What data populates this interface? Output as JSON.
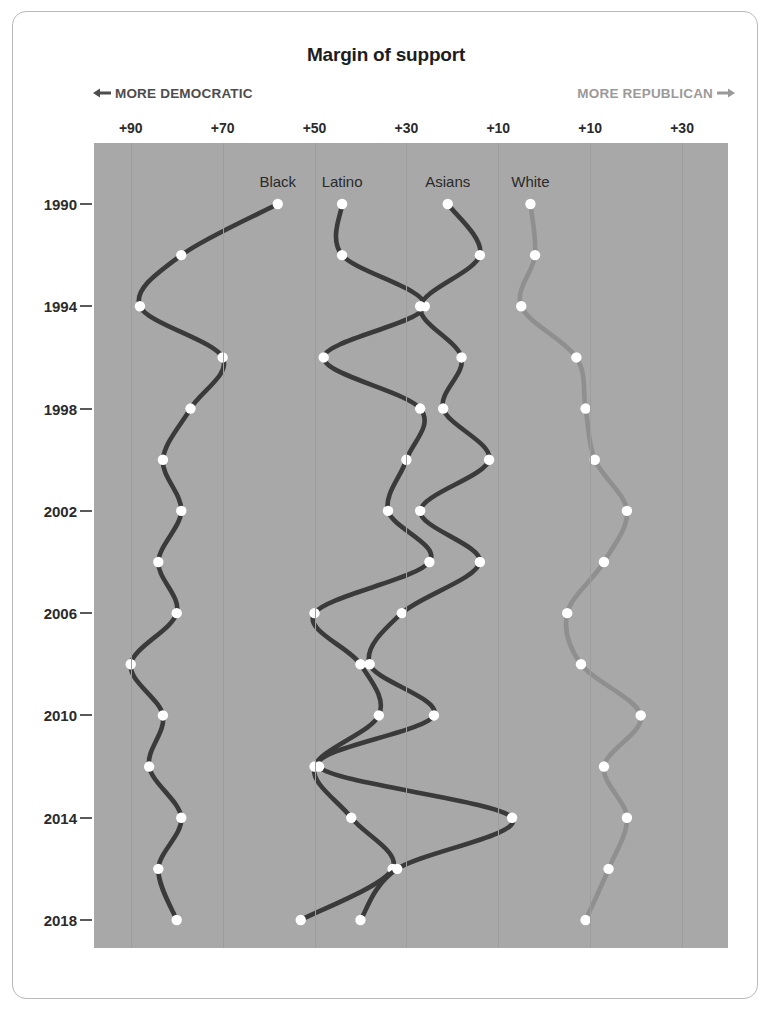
{
  "title": "Margin of support",
  "direction_left": {
    "label": "MORE DEMOCRATIC",
    "arrow": "←"
  },
  "direction_right": {
    "label": "MORE REPUBLICAN",
    "arrow": "→"
  },
  "colors": {
    "plot_background": "#a8a8a8",
    "gridline": "#9d9d9d",
    "dark_series": "#3a3a3a",
    "light_series": "#8f8f8f",
    "marker": "#ffffff",
    "text": "#2b2b2b",
    "democratic_label": "#4d4d4d",
    "republican_label": "#9a9a9a"
  },
  "chart_data": {
    "type": "line",
    "title": "Margin of support",
    "xlabel": "",
    "ylabel": "",
    "orientation": "horizontal-value-vertical-time",
    "grid": true,
    "legend_position": "inline-top",
    "note": "X axis is a two-sided margin: values left of zero are Democratic margin, right of zero are Republican margin. Tick labels read +90 +70 +50 +30 +10 (Democratic) then +10 +30 (Republican).",
    "xtick_labels": [
      "+90",
      "+70",
      "+50",
      "+30",
      "+10",
      "+10",
      "+30"
    ],
    "xtick_values": [
      -90,
      -70,
      -50,
      -30,
      -10,
      10,
      30
    ],
    "xlim": [
      -98,
      40
    ],
    "ylim": [
      1990,
      2018
    ],
    "ytick_labels": [
      "1990",
      "1994",
      "1998",
      "2002",
      "2006",
      "2010",
      "2014",
      "2018"
    ],
    "ytick_values": [
      1990,
      1994,
      1998,
      2002,
      2006,
      2010,
      2014,
      2018
    ],
    "x": [
      1990,
      1992,
      1994,
      1996,
      1998,
      2000,
      2002,
      2004,
      2006,
      2008,
      2010,
      2012,
      2014,
      2016,
      2018
    ],
    "series": [
      {
        "name": "Black",
        "color": "#3a3a3a",
        "values": [
          -58,
          -79,
          -88,
          -70,
          -77,
          -83,
          -79,
          -84,
          -80,
          -90,
          -83,
          -86,
          -79,
          -84,
          -80
        ]
      },
      {
        "name": "Latino",
        "color": "#3a3a3a",
        "values": [
          -44,
          -44,
          -26,
          -48,
          -27,
          -30,
          -34,
          -25,
          -50,
          -40,
          -36,
          -50,
          -42,
          -33,
          -53
        ]
      },
      {
        "name": "Asians",
        "color": "#3a3a3a",
        "values": [
          -21,
          -14,
          -27,
          -18,
          -22,
          -12,
          -27,
          -14,
          -31,
          -38,
          -24,
          -49,
          -7,
          -32,
          -40
        ]
      },
      {
        "name": "White",
        "color": "#8f8f8f",
        "values": [
          -3,
          -2,
          -5,
          7,
          9,
          11,
          18,
          13,
          5,
          8,
          21,
          13,
          18,
          14,
          9
        ]
      }
    ]
  },
  "series_labels": [
    {
      "name": "Black"
    },
    {
      "name": "Latino"
    },
    {
      "name": "Asians"
    },
    {
      "name": "White"
    }
  ]
}
